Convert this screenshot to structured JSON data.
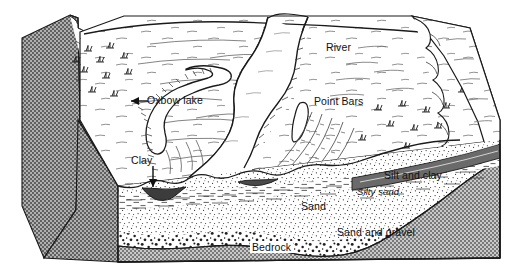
{
  "figure": {
    "type": "geologic-block-diagram",
    "style": "black-and-white line drawing, stippled and hatched textures"
  },
  "labels": {
    "oxbow_lake": "Oxbow lake",
    "river": "River",
    "point_bars": "Point Bars",
    "clay": "Clay",
    "silt_and_clay": "Silt and clay",
    "silty_sand": "Silty  sand",
    "sand": "Sand",
    "sand_and_gravel": "Sand and gravel",
    "bedrock": "Bedrock"
  },
  "layers": [
    {
      "name": "Silt and clay",
      "texture": "dashes",
      "position": "uppermost cross-section band, right"
    },
    {
      "name": "Silty  sand",
      "texture": "fine dashes",
      "position": "upper cross-section band"
    },
    {
      "name": "Sand",
      "texture": "fine stipple",
      "position": "middle cross-section body"
    },
    {
      "name": "Sand and gravel",
      "texture": "coarse dots",
      "position": "lower cross-section band"
    },
    {
      "name": "Bedrock",
      "texture": "gray checker stipple",
      "position": "base of block"
    }
  ],
  "surface_features": [
    {
      "name": "Oxbow lake",
      "description": "abandoned meander loop on left floodplain"
    },
    {
      "name": "River",
      "description": "active meandering channel, S-shaped"
    },
    {
      "name": "Point Bars",
      "description": "arcuate scroll ridges inside meander bends"
    },
    {
      "name": "Clay",
      "description": "dark clay plug lens in the cross-section, marked by a down arrow"
    },
    {
      "name": "Marsh",
      "description": "grass tuft symbols on floodplain"
    },
    {
      "name": "Bluff",
      "description": "eroding valley wall on left and right edges"
    }
  ],
  "colors": {
    "ink": "#1a1a1a",
    "paper": "#ffffff",
    "bedrock_gray": "#9a9a9a",
    "bedrock_gray_dark": "#7e7e7e",
    "clay_dark": "#3c3c3c"
  },
  "annotations": [
    {
      "label": "Oxbow lake",
      "arrow": "left-pointing arrow to oxbow loop"
    },
    {
      "label": "Clay",
      "arrow": "down-pointing arrow to clay lens"
    }
  ]
}
